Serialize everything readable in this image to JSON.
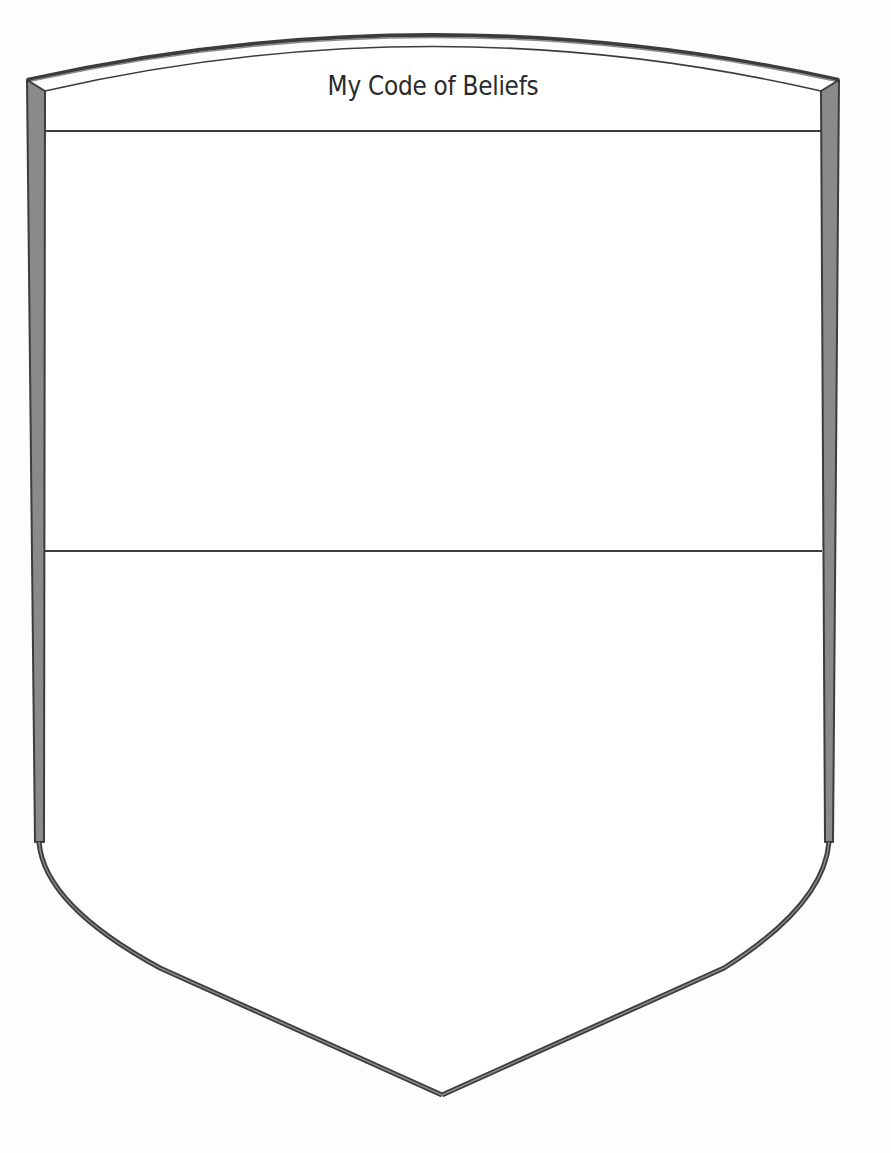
{
  "worksheet": {
    "title": "My Code of Beliefs",
    "sections": [
      {
        "id": "section-top",
        "label": ""
      },
      {
        "id": "section-bottom",
        "label": ""
      }
    ]
  },
  "colors": {
    "border_fill": "#8a8a8a",
    "border_stroke": "#3c3c3c",
    "divider": "#3c3c3c",
    "background": "#ffffff",
    "text": "#2a2a2a"
  },
  "icons": {
    "shield": "shield-outline"
  }
}
